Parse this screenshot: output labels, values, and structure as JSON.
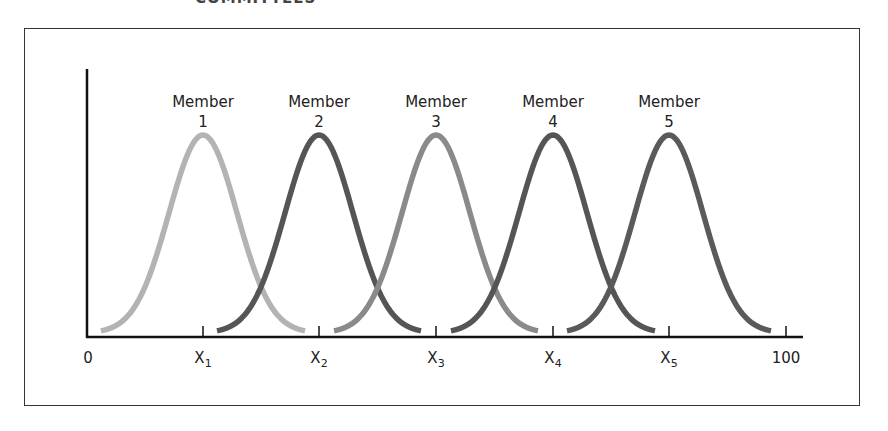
{
  "header": {
    "partial_title": "COMMITTEES"
  },
  "chart_data": {
    "type": "line",
    "title": "",
    "xlabel": "",
    "ylabel": "",
    "x_range": [
      0,
      100
    ],
    "tick_labels": [
      "0",
      "X1",
      "X2",
      "X3",
      "X4",
      "X5",
      "100"
    ],
    "series": [
      {
        "name": "Member 1",
        "label_line1": "Member",
        "label_line2": "1",
        "peak_x": "X1",
        "color": "#b3b3b3"
      },
      {
        "name": "Member 2",
        "label_line1": "Member",
        "label_line2": "2",
        "peak_x": "X2",
        "color": "#555555"
      },
      {
        "name": "Member 3",
        "label_line1": "Member",
        "label_line2": "3",
        "peak_x": "X3",
        "color": "#8a8a8a"
      },
      {
        "name": "Member 4",
        "label_line1": "Member",
        "label_line2": "4",
        "peak_x": "X4",
        "color": "#555555"
      },
      {
        "name": "Member 5",
        "label_line1": "Member",
        "label_line2": "5",
        "peak_x": "X5",
        "color": "#5a5a5a"
      }
    ],
    "shape": "bell curves of equal height, each centered at its member's X position",
    "grid": false,
    "legend": "labels above each curve"
  }
}
